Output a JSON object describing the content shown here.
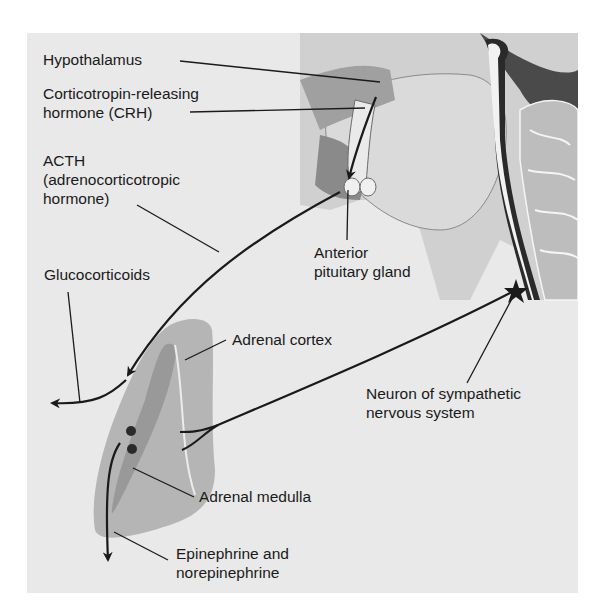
{
  "figure": {
    "colors": {
      "background": "#ffffff",
      "panel": "#e9e9e9",
      "brain_tissue": "#d8d8d8",
      "brain_dark": "#5a5a5a",
      "adrenal_cortex": "#b5b5b5",
      "adrenal_medulla": "#a3a3a3",
      "line": "#1a1a1a"
    },
    "labels": {
      "hypothalamus": "Hypothalamus",
      "crh_line1": "Corticotropin-releasing",
      "crh_line2": "hormone (CRH)",
      "acth_line1": "ACTH",
      "acth_line2": "(adrenocorticotropic",
      "acth_line3": "hormone)",
      "anterior_pituitary_line1": "Anterior",
      "anterior_pituitary_line2": "pituitary gland",
      "glucocorticoids": "Glucocorticoids",
      "adrenal_cortex": "Adrenal cortex",
      "neuron_line1": "Neuron of sympathetic",
      "neuron_line2": "nervous system",
      "adrenal_medulla": "Adrenal medulla",
      "epi_line1": "Epinephrine and",
      "epi_line2": "norepinephrine"
    }
  }
}
